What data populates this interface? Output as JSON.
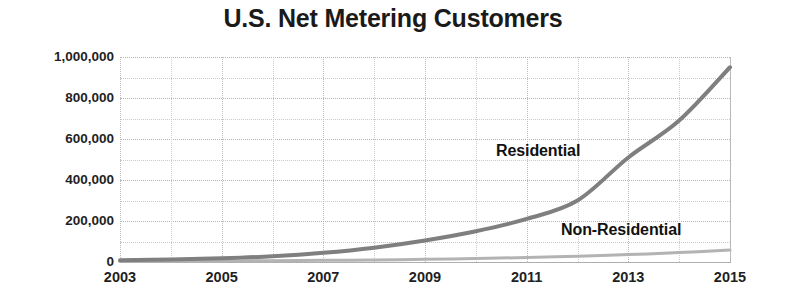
{
  "chart_data": {
    "type": "line",
    "title": "U.S. Net Metering Customers",
    "xlabel": "",
    "ylabel": "",
    "x": [
      2003,
      2004,
      2005,
      2006,
      2007,
      2008,
      2009,
      2010,
      2011,
      2012,
      2013,
      2014,
      2015
    ],
    "xlim": [
      2003,
      2015
    ],
    "ylim": [
      0,
      1000000
    ],
    "grid": true,
    "legend_position": "inline-annotations",
    "y_major_step": 200000,
    "y_minor_step": 100000,
    "series": [
      {
        "name": "Residential",
        "color": "#7f7f7f",
        "line_width": 4,
        "values": [
          8000,
          12000,
          18000,
          28000,
          45000,
          70000,
          105000,
          150000,
          210000,
          300000,
          510000,
          690000,
          950000
        ]
      },
      {
        "name": "Non-Residential",
        "color": "#b3b3b3",
        "line_width": 3,
        "values": [
          3000,
          4000,
          5000,
          6500,
          8000,
          10000,
          13000,
          17000,
          22000,
          28000,
          36000,
          46000,
          58000
        ]
      }
    ],
    "y_tick_labels": [
      "0",
      "200,000",
      "400,000",
      "600,000",
      "800,000",
      "1,000,000"
    ],
    "y_tick_values": [
      0,
      200000,
      400000,
      600000,
      800000,
      1000000
    ],
    "x_tick_labels": [
      "2003",
      "2005",
      "2007",
      "2009",
      "2011",
      "2013",
      "2015"
    ],
    "x_tick_values": [
      2003,
      2005,
      2007,
      2009,
      2011,
      2013,
      2015
    ],
    "annotations": [
      {
        "text": "Residential",
        "series": "Residential"
      },
      {
        "text": "Non-Residential",
        "series": "Non-Residential"
      }
    ]
  },
  "colors": {
    "background": "#ffffff",
    "title": "#1a1a1a",
    "tick_label": "#1f1f1f",
    "gridline": "#c9c9c9",
    "axis": "#a8a8a8",
    "residential": "#7f7f7f",
    "non_residential": "#b3b3b3"
  }
}
